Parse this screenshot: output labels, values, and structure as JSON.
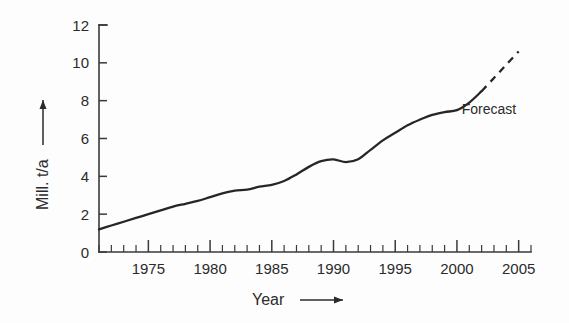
{
  "chart_data": {
    "type": "line",
    "title": "",
    "xlabel": "Year",
    "ylabel": "Mill. t/a",
    "xlim": [
      1971,
      2006
    ],
    "ylim": [
      0,
      12
    ],
    "grid": false,
    "legend_position": "none",
    "x_ticks_major": [
      1975,
      1980,
      1985,
      1990,
      1995,
      2000,
      2005
    ],
    "x_tick_labels": [
      "1975",
      "1980",
      "1985",
      "1990",
      "1995",
      "2000",
      "2005"
    ],
    "x_minor_tick_step": 1,
    "y_ticks_major": [
      0,
      2,
      4,
      6,
      8,
      10,
      12
    ],
    "y_tick_labels": [
      "0",
      "2",
      "4",
      "6",
      "8",
      "10",
      "12"
    ],
    "annotations": [
      {
        "text": "Forecast",
        "x": 2002.6,
        "y": 7.3
      }
    ],
    "series": [
      {
        "name": "Actual",
        "style": "solid",
        "x": [
          1971,
          1972,
          1973,
          1974,
          1975,
          1976,
          1977,
          1978,
          1979,
          1980,
          1981,
          1982,
          1983,
          1984,
          1985,
          1986,
          1987,
          1988,
          1989,
          1990,
          1991,
          1992,
          1993,
          1994,
          1995,
          1996,
          1997,
          1998,
          1999,
          2000,
          2001,
          2002
        ],
        "values": [
          1.2,
          1.4,
          1.6,
          1.8,
          2.0,
          2.2,
          2.4,
          2.55,
          2.7,
          2.9,
          3.1,
          3.25,
          3.3,
          3.45,
          3.55,
          3.75,
          4.1,
          4.5,
          4.8,
          4.9,
          4.75,
          4.9,
          5.4,
          5.9,
          6.3,
          6.7,
          7.0,
          7.25,
          7.4,
          7.5,
          7.9,
          8.5
        ]
      },
      {
        "name": "Forecast",
        "style": "dashed",
        "x": [
          2002,
          2003,
          2004,
          2005
        ],
        "values": [
          8.5,
          9.2,
          9.9,
          10.6
        ]
      }
    ]
  },
  "axis": {
    "y_title": "Mill. t/a",
    "x_title": "Year"
  },
  "colors": {
    "line": "#262626",
    "axis": "#3a3a3a",
    "text": "#2b2b2b",
    "background": "#fdfdfd"
  }
}
